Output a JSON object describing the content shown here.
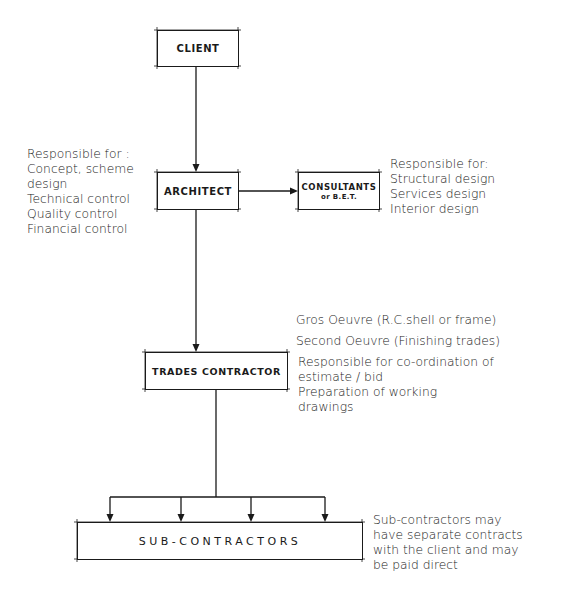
{
  "diagram": {
    "type": "organization-chart",
    "nodes": {
      "client": {
        "label": "CLIENT"
      },
      "architect": {
        "label": "ARCHITECT"
      },
      "consultants": {
        "label": "CONSULTANTS",
        "sublabel": "or B.E.T."
      },
      "trades_contractor": {
        "label": "TRADES CONTRACTOR"
      },
      "sub_contractors": {
        "label": "SUB-CONTRACTORS"
      }
    },
    "edges": [
      {
        "from": "client",
        "to": "architect"
      },
      {
        "from": "architect",
        "to": "consultants"
      },
      {
        "from": "architect",
        "to": "trades_contractor"
      },
      {
        "from": "trades_contractor",
        "to": "sub_contractors",
        "branches": 4
      }
    ],
    "notes": {
      "architect": {
        "lines": [
          "Responsible for :",
          "Concept, scheme",
          "design",
          "Technical control",
          "Quality control",
          "Financial control"
        ]
      },
      "consultants": {
        "lines": [
          "Responsible for:",
          "Structural design",
          "Services design",
          "Interior design"
        ]
      },
      "trades_contractor_work": {
        "lines": [
          "Gros Oeuvre (R.C.shell or frame)",
          "Second Oeuvre (Finishing trades)"
        ]
      },
      "trades_contractor": {
        "lines": [
          "Responsible for co-ordination of",
          "estimate / bid",
          "Preparation of working",
          "drawings"
        ]
      },
      "sub_contractors": {
        "lines": [
          "Sub-contractors may",
          "have separate contracts",
          "with the client and may",
          "be paid direct"
        ]
      }
    }
  }
}
